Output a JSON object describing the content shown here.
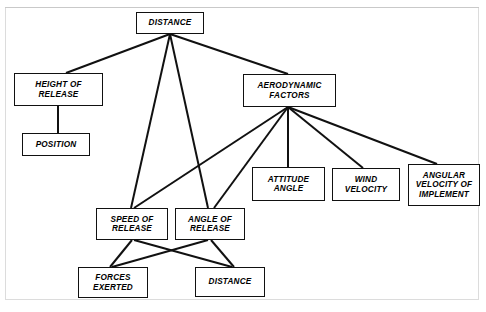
{
  "diagram": {
    "type": "hierarchical-flowchart",
    "title_text_present": false,
    "background_color": "#ffffff",
    "line_color": "#111111",
    "box_border_color": "#111111",
    "box_fill_color": "#ffffff",
    "nodes": [
      {
        "id": "distance_top",
        "label": "DISTANCE",
        "x": 136,
        "y": 12,
        "w": 68,
        "h": 22,
        "font_size": 8.2
      },
      {
        "id": "height_of_release",
        "label": "HEIGHT OF\nRELEASE",
        "x": 14,
        "y": 73,
        "w": 89,
        "h": 33,
        "font_size": 8.2
      },
      {
        "id": "position",
        "label": "POSITION",
        "x": 22,
        "y": 133,
        "w": 68,
        "h": 23,
        "font_size": 8.2
      },
      {
        "id": "aerodynamic_factors",
        "label": "AERODYNAMIC\nFACTORS",
        "x": 243,
        "y": 74,
        "w": 93,
        "h": 33,
        "font_size": 8.2
      },
      {
        "id": "attitude_angle",
        "label": "ATTITUDE\nANGLE",
        "x": 252,
        "y": 167,
        "w": 73,
        "h": 34,
        "font_size": 8.2
      },
      {
        "id": "wind_velocity",
        "label": "WIND\nVELOCITY",
        "x": 332,
        "y": 168,
        "w": 68,
        "h": 33,
        "font_size": 8.2
      },
      {
        "id": "angular_velocity_of_implement",
        "label": "ANGULAR\nVELOCITY OF\nIMPLEMENT",
        "x": 408,
        "y": 164,
        "w": 72,
        "h": 42,
        "font_size": 8.2
      },
      {
        "id": "speed_of_release",
        "label": "SPEED OF\nRELEASE",
        "x": 96,
        "y": 208,
        "w": 72,
        "h": 32,
        "font_size": 8.2
      },
      {
        "id": "angle_of_release",
        "label": "ANGLE OF\nRELEASE",
        "x": 175,
        "y": 208,
        "w": 70,
        "h": 32,
        "font_size": 8.2
      },
      {
        "id": "forces_exerted",
        "label": "FORCES\nEXERTED",
        "x": 78,
        "y": 267,
        "w": 70,
        "h": 31,
        "font_size": 8.2
      },
      {
        "id": "distance_bottom",
        "label": "DISTANCE",
        "x": 195,
        "y": 267,
        "w": 70,
        "h": 30,
        "font_size": 8.2
      }
    ],
    "edges": [
      {
        "from": "distance_top",
        "to": "height_of_release",
        "x1": 170,
        "y1": 34,
        "x2": 66,
        "y2": 73
      },
      {
        "from": "distance_top",
        "to": "aerodynamic_factors",
        "x1": 170,
        "y1": 34,
        "x2": 288,
        "y2": 74
      },
      {
        "from": "distance_top",
        "to": "speed_of_release",
        "x1": 170,
        "y1": 34,
        "x2": 131,
        "y2": 208
      },
      {
        "from": "distance_top",
        "to": "angle_of_release",
        "x1": 170,
        "y1": 34,
        "x2": 208,
        "y2": 208
      },
      {
        "from": "height_of_release",
        "to": "position",
        "x1": 58,
        "y1": 106,
        "x2": 58,
        "y2": 133
      },
      {
        "from": "aerodynamic_factors",
        "to": "speed_of_release",
        "x1": 288,
        "y1": 107,
        "x2": 134,
        "y2": 208
      },
      {
        "from": "aerodynamic_factors",
        "to": "angle_of_release",
        "x1": 288,
        "y1": 107,
        "x2": 214,
        "y2": 208
      },
      {
        "from": "aerodynamic_factors",
        "to": "attitude_angle",
        "x1": 288,
        "y1": 107,
        "x2": 288,
        "y2": 167
      },
      {
        "from": "aerodynamic_factors",
        "to": "wind_velocity",
        "x1": 288,
        "y1": 107,
        "x2": 363,
        "y2": 168
      },
      {
        "from": "aerodynamic_factors",
        "to": "angular_velocity_of_implement",
        "x1": 288,
        "y1": 107,
        "x2": 437,
        "y2": 164
      },
      {
        "from": "speed_of_release",
        "to": "forces_exerted",
        "x1": 132,
        "y1": 240,
        "x2": 110,
        "y2": 267
      },
      {
        "from": "speed_of_release",
        "to": "distance_bottom",
        "x1": 134,
        "y1": 240,
        "x2": 232,
        "y2": 267
      },
      {
        "from": "angle_of_release",
        "to": "forces_exerted",
        "x1": 208,
        "y1": 240,
        "x2": 112,
        "y2": 267
      },
      {
        "from": "angle_of_release",
        "to": "distance_bottom",
        "x1": 211,
        "y1": 240,
        "x2": 234,
        "y2": 267
      }
    ]
  }
}
